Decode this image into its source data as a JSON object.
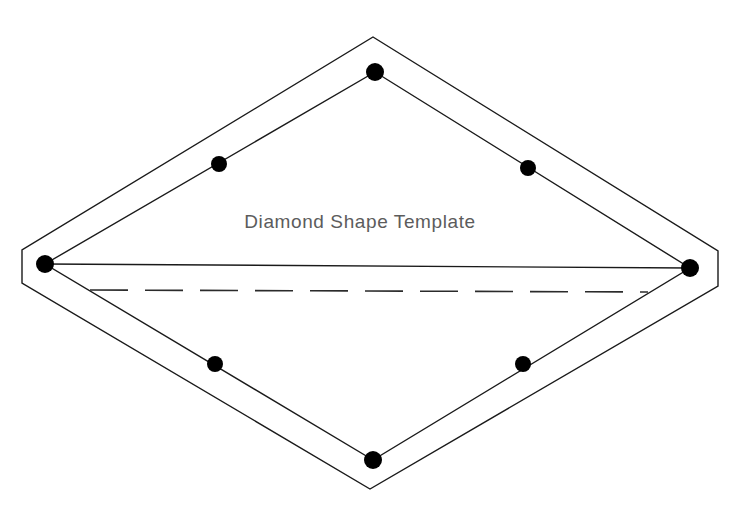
{
  "document": {
    "title": "Diamond Shape Template",
    "background_color": "#ffffff",
    "width": 734,
    "height": 523
  },
  "label": {
    "text": "Diamond Shape Template",
    "color": "#5c5c5c",
    "x": 360,
    "y": 228,
    "font_size": 19
  },
  "chart_data": {
    "type": "diagram",
    "title": "Diamond Shape Template",
    "stroke_color": "#1a1a1a",
    "dot_color": "#000000",
    "outer_border": {
      "name": "outer-octagonal-border",
      "points": "373,37 718,251 718,286 370,489 22,283 22,250",
      "stroke_width": 1.4,
      "closed": true
    },
    "inner_diamond": {
      "name": "inner-diamond",
      "points": "375,72 690,268 373,460 45,264",
      "stroke_width": 1.4,
      "closed": true
    },
    "horizontal_axis": {
      "name": "horizontal-solid-axis",
      "x1": 45,
      "y1": 264,
      "x2": 690,
      "y2": 268,
      "style": "solid",
      "stroke_width": 1.4
    },
    "dashed_axis": {
      "name": "dashed-guide-line",
      "x1": 90,
      "y1": 290,
      "x2": 648,
      "y2": 292,
      "style": "dashed",
      "dash_length": 38,
      "gap_length": 17,
      "stroke_width": 1.6
    },
    "vertex_dots": [
      {
        "name": "dot-top-vertex",
        "x": 375,
        "y": 72,
        "r": 9
      },
      {
        "name": "dot-left-vertex",
        "x": 45,
        "y": 264,
        "r": 9
      },
      {
        "name": "dot-right-vertex",
        "x": 690,
        "y": 268,
        "r": 9
      },
      {
        "name": "dot-bottom-vertex",
        "x": 373,
        "y": 460,
        "r": 9
      },
      {
        "name": "dot-upper-left-edge",
        "x": 219,
        "y": 164,
        "r": 8
      },
      {
        "name": "dot-upper-right-edge",
        "x": 528,
        "y": 168,
        "r": 8
      },
      {
        "name": "dot-lower-left-edge",
        "x": 215,
        "y": 364,
        "r": 8
      },
      {
        "name": "dot-lower-right-edge",
        "x": 523,
        "y": 364,
        "r": 8
      }
    ]
  }
}
